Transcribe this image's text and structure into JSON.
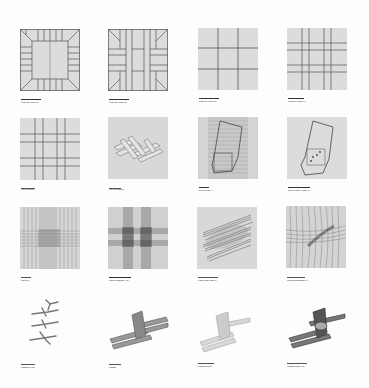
{
  "sheet": {
    "background": "#fdfdfd",
    "tile_background": "#dcdcdc",
    "line_color": "#555555"
  },
  "rows": [
    {
      "tiles": [
        {
          "caption": "LINE DRAWING 01",
          "kind": "grid-bevel-corners"
        },
        {
          "caption": "LINE DRAWING 02",
          "kind": "grid-interlock-diagonals"
        },
        {
          "caption": "LINE DRAWING 03",
          "kind": "grid-3x3"
        },
        {
          "caption": "LINE DRAWING 04",
          "kind": "grid-double-lines"
        }
      ]
    },
    {
      "tiles": [
        {
          "caption": "WEAVE GRID",
          "kind": "woven-grid"
        },
        {
          "caption": "WEAVE MODEL",
          "kind": "woven-model"
        },
        {
          "caption": "SITE OVERLAY",
          "kind": "site-outline-hatched"
        },
        {
          "caption": "SITE OVERLAY DETAIL",
          "kind": "site-outline-points"
        }
      ]
    },
    {
      "tiles": [
        {
          "caption": "FIELD 01",
          "kind": "dense-field-light"
        },
        {
          "caption": "FIELD INTENSITY 02",
          "kind": "dense-field-dark"
        },
        {
          "caption": "FIELD ROTATED 03",
          "kind": "rotated-bundles"
        },
        {
          "caption": "FIELD DISTORTED 04",
          "kind": "distorted-field"
        }
      ]
    },
    {
      "tiles": [
        {
          "caption": "MODEL STACK",
          "kind": "stacked-branches"
        },
        {
          "caption": "MODEL",
          "kind": "cross-bundle"
        },
        {
          "caption": "MODEL STUDY",
          "kind": "translucent-bundle"
        },
        {
          "caption": "MODEL STUDY 02",
          "kind": "dark-bundle"
        }
      ]
    }
  ]
}
